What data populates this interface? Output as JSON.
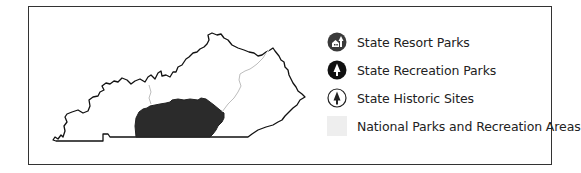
{
  "map": {
    "region": "Kentucky",
    "highlight_color": "#2b2b2b",
    "river_color": "#bdbdbd",
    "outline_color": "#111111"
  },
  "legend": {
    "items": [
      {
        "icon": "resort-park-icon",
        "label": "State Resort Parks",
        "color": "#3a3a3a"
      },
      {
        "icon": "recreation-park-icon",
        "label": "State Recreation Parks",
        "color": "#111111"
      },
      {
        "icon": "historic-site-icon",
        "label": "State Historic Sites",
        "color": "#222222"
      },
      {
        "icon": "national-park-swatch",
        "label": "National Parks and Recreation Areas",
        "color": "#eeeeee"
      }
    ]
  }
}
